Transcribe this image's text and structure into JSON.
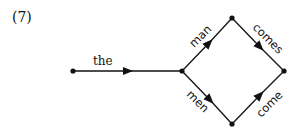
{
  "example_number": "(7)",
  "diagram": {
    "type": "finite-state-network",
    "nodes": [
      {
        "id": "n0",
        "x": 73,
        "y": 71
      },
      {
        "id": "n1",
        "x": 182,
        "y": 71
      },
      {
        "id": "n2",
        "x": 232,
        "y": 18
      },
      {
        "id": "n3",
        "x": 232,
        "y": 124
      },
      {
        "id": "n4",
        "x": 284,
        "y": 71
      }
    ],
    "edges": [
      {
        "from": "n0",
        "to": "n1",
        "label": "the"
      },
      {
        "from": "n1",
        "to": "n2",
        "label": "man"
      },
      {
        "from": "n2",
        "to": "n4",
        "label": "comes"
      },
      {
        "from": "n1",
        "to": "n3",
        "label": "men"
      },
      {
        "from": "n3",
        "to": "n4",
        "label": "come"
      }
    ]
  }
}
